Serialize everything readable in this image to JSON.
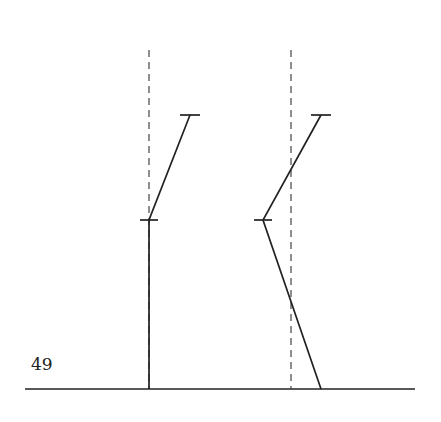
{
  "page_number": "49",
  "figure": {
    "colors": {
      "stroke": "#222222",
      "dashed": "#444444"
    },
    "baseline": {
      "x1": 25,
      "x2": 415,
      "y": 389
    },
    "panels": [
      {
        "name": "left",
        "reference_line": {
          "x": 149,
          "y1": 50,
          "y2": 389
        },
        "polyline": [
          [
            149,
            389
          ],
          [
            149,
            220
          ],
          [
            190,
            115
          ]
        ],
        "ticks": [
          {
            "x": 149,
            "y": 220,
            "half_width": 9
          },
          {
            "x": 190,
            "y": 115,
            "half_width": 10
          }
        ]
      },
      {
        "name": "right",
        "reference_line": {
          "x": 291,
          "y1": 50,
          "y2": 389
        },
        "polyline": [
          [
            321,
            389
          ],
          [
            263,
            220
          ],
          [
            321,
            115
          ]
        ],
        "ticks": [
          {
            "x": 263,
            "y": 220,
            "half_width": 9
          },
          {
            "x": 321,
            "y": 115,
            "half_width": 10
          }
        ]
      }
    ]
  }
}
